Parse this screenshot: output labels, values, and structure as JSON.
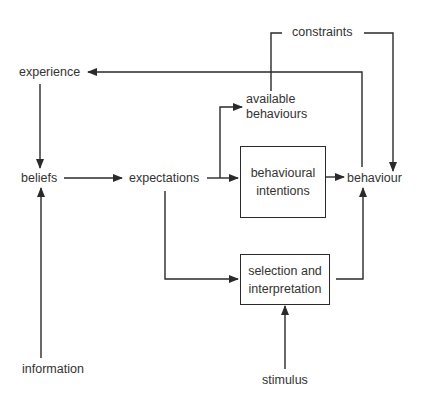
{
  "diagram": {
    "nodes": {
      "experience": "experience",
      "beliefs": "beliefs",
      "information": "information",
      "expectations": "expectations",
      "constraints": "constraints",
      "available_behaviours_line1": "available",
      "available_behaviours_line2": "behaviours",
      "behavioural_intentions_line1": "behavioural",
      "behavioural_intentions_line2": "intentions",
      "selection_interpretation_line1": "selection and",
      "selection_interpretation_line2": "interpretation",
      "behaviour": "behaviour",
      "stimulus": "stimulus"
    },
    "edges": [
      {
        "from": "experience",
        "to": "beliefs"
      },
      {
        "from": "information",
        "to": "beliefs"
      },
      {
        "from": "beliefs",
        "to": "expectations"
      },
      {
        "from": "expectations",
        "to": "available behaviours"
      },
      {
        "from": "expectations",
        "to": "behavioural intentions"
      },
      {
        "from": "expectations",
        "to": "selection and interpretation"
      },
      {
        "from": "constraints",
        "to": "available behaviours"
      },
      {
        "from": "constraints",
        "to": "behaviour"
      },
      {
        "from": "behavioural intentions",
        "to": "behaviour"
      },
      {
        "from": "selection and interpretation",
        "to": "behaviour"
      },
      {
        "from": "stimulus",
        "to": "selection and interpretation"
      },
      {
        "from": "behaviour",
        "to": "experience"
      }
    ],
    "line_color": "#2a2a2a"
  }
}
